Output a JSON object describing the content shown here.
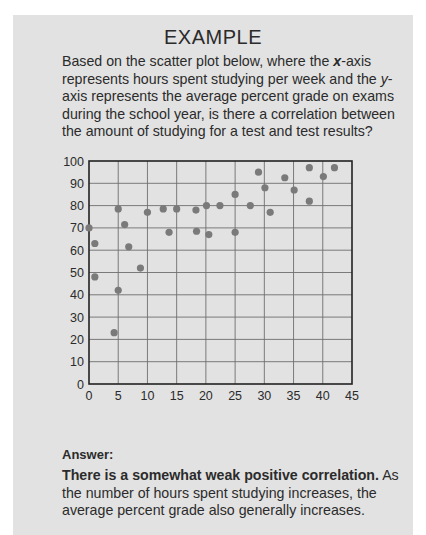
{
  "header": {
    "clipped_text": "ᵖ ᵖ"
  },
  "example": {
    "title": "EXAMPLE",
    "question_parts": {
      "p1": "Based on the scatter plot below, where the ",
      "x_var": "x",
      "p2": "-axis represents hours spent studying per week and the ",
      "y_var": "y",
      "p3": "-axis represents the average percent grade on exams during the school year, is there a correlation between the amount of studying for a test and test results?"
    },
    "answer_label": "Answer:",
    "answer_bold": "There is a somewhat weak positive correlation.",
    "answer_rest": " As the number of hours spent studying increases, the average percent grade also generally increases."
  },
  "colors": {
    "box_background": "#e2e2e2",
    "point_color": "#7a7a7a",
    "grid_color": "#6e6e6e",
    "axis_color": "#222222"
  },
  "chart_data": {
    "type": "scatter",
    "title": "",
    "xlabel": "",
    "ylabel": "",
    "xlim": [
      0,
      45
    ],
    "ylim": [
      0,
      100
    ],
    "x_ticks": [
      0,
      5,
      10,
      15,
      20,
      25,
      30,
      35,
      40,
      45
    ],
    "y_ticks": [
      0,
      10,
      20,
      30,
      40,
      50,
      60,
      70,
      80,
      90,
      100
    ],
    "grid": true,
    "legend": null,
    "series": [
      {
        "name": "students",
        "points": [
          {
            "x": 0,
            "y": 70
          },
          {
            "x": 1,
            "y": 63
          },
          {
            "x": 1,
            "y": 48
          },
          {
            "x": 4.3,
            "y": 23
          },
          {
            "x": 5,
            "y": 42
          },
          {
            "x": 5,
            "y": 78.5
          },
          {
            "x": 6.1,
            "y": 71.5
          },
          {
            "x": 6.8,
            "y": 61.5
          },
          {
            "x": 8.8,
            "y": 52
          },
          {
            "x": 10,
            "y": 77
          },
          {
            "x": 12.7,
            "y": 78.5
          },
          {
            "x": 13.7,
            "y": 68
          },
          {
            "x": 15,
            "y": 78.5
          },
          {
            "x": 18.3,
            "y": 78
          },
          {
            "x": 18.4,
            "y": 68.5
          },
          {
            "x": 20.1,
            "y": 80
          },
          {
            "x": 20.5,
            "y": 67
          },
          {
            "x": 22.4,
            "y": 80
          },
          {
            "x": 25,
            "y": 85
          },
          {
            "x": 25,
            "y": 68
          },
          {
            "x": 27.6,
            "y": 80
          },
          {
            "x": 29,
            "y": 95
          },
          {
            "x": 30.1,
            "y": 88
          },
          {
            "x": 31,
            "y": 77
          },
          {
            "x": 33.5,
            "y": 92.5
          },
          {
            "x": 35.1,
            "y": 87
          },
          {
            "x": 37.7,
            "y": 97
          },
          {
            "x": 37.7,
            "y": 82
          },
          {
            "x": 40.1,
            "y": 93
          },
          {
            "x": 42,
            "y": 97
          }
        ]
      }
    ],
    "plot_px": {
      "left": 89,
      "right": 352,
      "top": 161,
      "bottom": 384
    }
  }
}
